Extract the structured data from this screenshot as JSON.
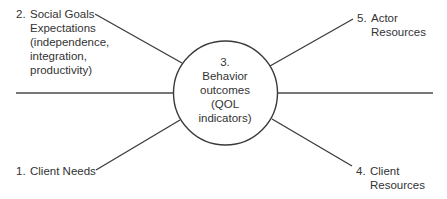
{
  "diagram": {
    "center": {
      "number": "3.",
      "lines": [
        "Behavior",
        "outcomes",
        "(QOL",
        "indicators)"
      ]
    },
    "nodes": [
      {
        "id": 1,
        "number": "1.",
        "lines": [
          "Client Needs"
        ]
      },
      {
        "id": 2,
        "number": "2.",
        "lines": [
          "Social Goals",
          "Expectations",
          "(independence,",
          "integration,",
          "productivity)"
        ]
      },
      {
        "id": 4,
        "number": "4.",
        "lines": [
          "Client",
          "Resources"
        ]
      },
      {
        "id": 5,
        "number": "5.",
        "lines": [
          "Actor",
          "Resources"
        ]
      }
    ],
    "colors": {
      "line": "#3a3a3a",
      "circle": "#3a3a3a",
      "text": "#333333",
      "background": "#ffffff"
    }
  }
}
